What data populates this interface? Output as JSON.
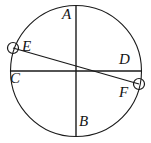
{
  "figure": {
    "type": "circle-with-two-diameters-and-chord",
    "canvas": {
      "width": 151,
      "height": 143,
      "background": "#ffffff"
    },
    "stroke_color": "#1a1a1a",
    "label_color": "#141414",
    "circle": {
      "cx": 76,
      "cy": 71,
      "r": 65.5,
      "stroke_width": 1.1
    },
    "lines": [
      {
        "name": "diameter-AB",
        "x1": 76,
        "y1": 5.5,
        "x2": 76,
        "y2": 136.5,
        "stroke_width": 1.4
      },
      {
        "name": "diameter-CD",
        "x1": 10.5,
        "y1": 71,
        "x2": 141.5,
        "y2": 71,
        "stroke_width": 1.4
      },
      {
        "name": "chord-EF",
        "x1": 13,
        "y1": 48,
        "x2": 139,
        "y2": 84,
        "stroke_width": 1.2
      }
    ],
    "markers": [
      {
        "name": "point-marker-E",
        "cx": 13,
        "cy": 48,
        "r": 5.5,
        "stroke_width": 1.2
      },
      {
        "name": "point-marker-F",
        "cx": 139,
        "cy": 84,
        "r": 5.5,
        "stroke_width": 1.2
      }
    ],
    "labels": [
      {
        "id": "A",
        "text": "A"
      },
      {
        "id": "B",
        "text": "B"
      },
      {
        "id": "C",
        "text": "C"
      },
      {
        "id": "D",
        "text": "D"
      },
      {
        "id": "E",
        "text": "E"
      },
      {
        "id": "F",
        "text": "F"
      }
    ]
  }
}
